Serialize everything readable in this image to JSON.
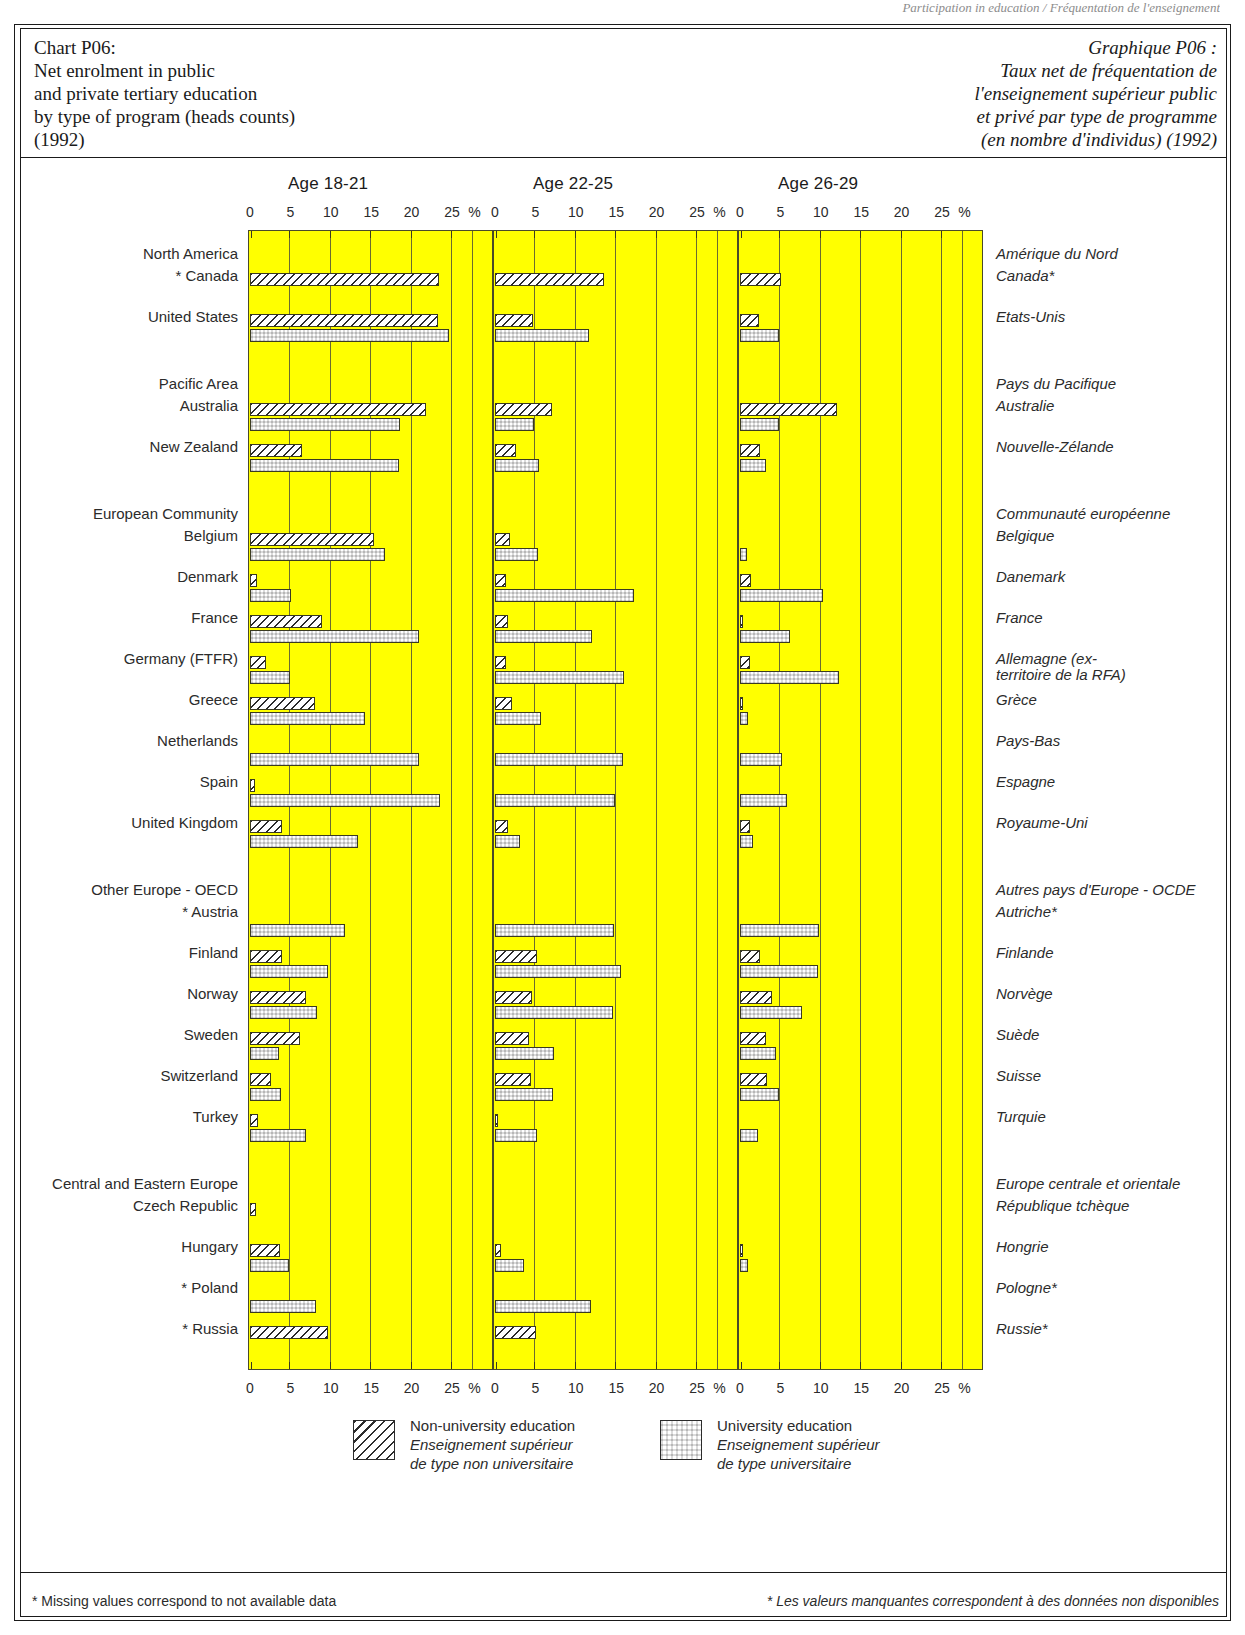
{
  "header_crumb": "Participation in education / Fréquentation de l'enseignement",
  "title": {
    "en": "Chart P06:\nNet enrolment in public\nand private tertiary education\nby type of program (heads counts)\n(1992)",
    "fr": "Graphique P06 :\nTaux net de fréquentation de\nl'enseignement supérieur public\net privé par type de programme\n(en nombre d'individus) (1992)"
  },
  "legend": {
    "nonuniversity": {
      "en": "Non-university education",
      "fr": "Enseignement supérieur\nde type non universitaire",
      "icon": "hatch-swatch"
    },
    "university": {
      "en": "University education",
      "fr": "Enseignement supérieur\nde type universitaire",
      "icon": "checker-swatch"
    }
  },
  "footnotes": {
    "en": "* Missing values correspond to not available data",
    "fr": "* Les valeurs manquantes correspondent à des données non disponibles"
  },
  "chart_data": {
    "type": "bar",
    "orientation": "horizontal",
    "title": "Net enrolment in public and private tertiary education by type of program (heads counts) (1992)",
    "xlabel": "%",
    "ylabel": "",
    "xlim": [
      0,
      30
    ],
    "ticks": [
      0,
      5,
      10,
      15,
      20,
      25
    ],
    "tick_labels": [
      "0",
      "5",
      "10",
      "15",
      "20",
      "25"
    ],
    "unit_label": "%",
    "grid": true,
    "legend_position": "bottom",
    "panels": [
      {
        "id": "age-18-21",
        "label": "Age 18-21"
      },
      {
        "id": "age-22-25",
        "label": "Age 22-25"
      },
      {
        "id": "age-26-29",
        "label": "Age 26-29"
      }
    ],
    "series": [
      {
        "name": "Non-university education",
        "key": "nonuni",
        "pattern": "diagonal-hatch"
      },
      {
        "name": "University education",
        "key": "uni",
        "pattern": "checkerboard"
      }
    ],
    "groups": [
      {
        "label_en": "North America",
        "label_fr": "Amérique du Nord",
        "rows": [
          {
            "label_en": "* Canada",
            "label_fr": "Canada*",
            "age_18_21": {
              "nonuni": 23.4,
              "uni": null
            },
            "age_22_25": {
              "nonuni": 13.5,
              "uni": null
            },
            "age_26_29": {
              "nonuni": 5.1,
              "uni": null
            }
          },
          {
            "label_en": "United States",
            "label_fr": "Etats-Unis",
            "age_18_21": {
              "nonuni": 23.3,
              "uni": 24.6
            },
            "age_22_25": {
              "nonuni": 4.7,
              "uni": 11.6
            },
            "age_26_29": {
              "nonuni": 2.4,
              "uni": 4.8
            }
          }
        ]
      },
      {
        "label_en": "Pacific Area",
        "label_fr": "Pays du Pacifique",
        "rows": [
          {
            "label_en": "Australia",
            "label_fr": "Australie",
            "age_18_21": {
              "nonuni": 21.8,
              "uni": 18.6
            },
            "age_22_25": {
              "nonuni": 7.1,
              "uni": 4.8
            },
            "age_26_29": {
              "nonuni": 12.0,
              "uni": 4.8
            }
          },
          {
            "label_en": "New Zealand",
            "label_fr": "Nouvelle-Zélande",
            "age_18_21": {
              "nonuni": 6.4,
              "uni": 18.5
            },
            "age_22_25": {
              "nonuni": 2.6,
              "uni": 5.5
            },
            "age_26_29": {
              "nonuni": 2.5,
              "uni": 3.2
            }
          }
        ]
      },
      {
        "label_en": "European Community",
        "label_fr": "Communauté européenne",
        "rows": [
          {
            "label_en": "Belgium",
            "label_fr": "Belgique",
            "age_18_21": {
              "nonuni": 15.3,
              "uni": 16.7
            },
            "age_22_25": {
              "nonuni": 1.9,
              "uni": 5.3
            },
            "age_26_29": {
              "nonuni": null,
              "uni": 0.9
            }
          },
          {
            "label_en": "Denmark",
            "label_fr": "Danemark",
            "age_18_21": {
              "nonuni": 0.9,
              "uni": 5.1
            },
            "age_22_25": {
              "nonuni": 1.4,
              "uni": 17.2
            },
            "age_26_29": {
              "nonuni": 1.3,
              "uni": 10.3
            }
          },
          {
            "label_en": "France",
            "label_fr": "France",
            "age_18_21": {
              "nonuni": 8.9,
              "uni": 20.9
            },
            "age_22_25": {
              "nonuni": 1.6,
              "uni": 12.0
            },
            "age_26_29": {
              "nonuni": 0.4,
              "uni": 6.2
            }
          },
          {
            "label_en": "Germany (FTFR)",
            "label_fr": "Allemagne (ex-\nterritoire de la RFA)",
            "age_18_21": {
              "nonuni": 2.0,
              "uni": 4.9
            },
            "age_22_25": {
              "nonuni": 1.3,
              "uni": 16.0
            },
            "age_26_29": {
              "nonuni": 1.2,
              "uni": 12.2
            }
          },
          {
            "label_en": "Greece",
            "label_fr": "Grèce",
            "age_18_21": {
              "nonuni": 8.0,
              "uni": 14.2
            },
            "age_22_25": {
              "nonuni": 2.1,
              "uni": 5.7
            },
            "age_26_29": {
              "nonuni": 0.4,
              "uni": 1.0
            }
          },
          {
            "label_en": "Netherlands",
            "label_fr": "Pays-Bas",
            "age_18_21": {
              "nonuni": null,
              "uni": 20.9
            },
            "age_22_25": {
              "nonuni": null,
              "uni": 15.8
            },
            "age_26_29": {
              "nonuni": null,
              "uni": 5.2
            }
          },
          {
            "label_en": "Spain",
            "label_fr": "Espagne",
            "age_18_21": {
              "nonuni": 0.6,
              "uni": 23.5
            },
            "age_22_25": {
              "nonuni": null,
              "uni": 14.8
            },
            "age_26_29": {
              "nonuni": null,
              "uni": 5.8
            }
          },
          {
            "label_en": "United Kingdom",
            "label_fr": "Royaume-Uni",
            "age_18_21": {
              "nonuni": 4.0,
              "uni": 13.4
            },
            "age_22_25": {
              "nonuni": 1.6,
              "uni": 3.1
            },
            "age_26_29": {
              "nonuni": 1.2,
              "uni": 1.6
            }
          }
        ]
      },
      {
        "label_en": "Other Europe - OECD",
        "label_fr": "Autres pays d'Europe - OCDE",
        "rows": [
          {
            "label_en": "* Austria",
            "label_fr": "Autriche*",
            "age_18_21": {
              "nonuni": null,
              "uni": 11.8
            },
            "age_22_25": {
              "nonuni": null,
              "uni": 14.7
            },
            "age_26_29": {
              "nonuni": null,
              "uni": 9.8
            }
          },
          {
            "label_en": "Finland",
            "label_fr": "Finlande",
            "age_18_21": {
              "nonuni": 4.0,
              "uni": 9.7
            },
            "age_22_25": {
              "nonuni": 5.2,
              "uni": 15.6
            },
            "age_26_29": {
              "nonuni": 2.5,
              "uni": 9.7
            }
          },
          {
            "label_en": "Norway",
            "label_fr": "Norvège",
            "age_18_21": {
              "nonuni": 6.9,
              "uni": 8.3
            },
            "age_22_25": {
              "nonuni": 4.6,
              "uni": 14.6
            },
            "age_26_29": {
              "nonuni": 3.9,
              "uni": 7.7
            }
          },
          {
            "label_en": "Sweden",
            "label_fr": "Suède",
            "age_18_21": {
              "nonuni": 6.2,
              "uni": 3.6
            },
            "age_22_25": {
              "nonuni": 4.2,
              "uni": 7.3
            },
            "age_26_29": {
              "nonuni": 3.2,
              "uni": 4.4
            }
          },
          {
            "label_en": "Switzerland",
            "label_fr": "Suisse",
            "age_18_21": {
              "nonuni": 2.6,
              "uni": 3.8
            },
            "age_22_25": {
              "nonuni": 4.4,
              "uni": 7.2
            },
            "age_26_29": {
              "nonuni": 3.4,
              "uni": 4.8
            }
          },
          {
            "label_en": "Turkey",
            "label_fr": "Turquie",
            "age_18_21": {
              "nonuni": 1.0,
              "uni": 6.9
            },
            "age_22_25": {
              "nonuni": 0.2,
              "uni": 5.2
            },
            "age_26_29": {
              "nonuni": null,
              "uni": 2.2
            }
          }
        ]
      },
      {
        "label_en": "Central and Eastern Europe",
        "label_fr": "Europe centrale et orientale",
        "rows": [
          {
            "label_en": "Czech Republic",
            "label_fr": "République tchèque",
            "age_18_21": {
              "nonuni": 0.7,
              "uni": null
            },
            "age_22_25": {
              "nonuni": null,
              "uni": null
            },
            "age_26_29": {
              "nonuni": null,
              "uni": null
            }
          },
          {
            "label_en": "Hungary",
            "label_fr": "Hongrie",
            "age_18_21": {
              "nonuni": 3.7,
              "uni": 4.8
            },
            "age_22_25": {
              "nonuni": 0.8,
              "uni": 3.6
            },
            "age_26_29": {
              "nonuni": 0.3,
              "uni": 1.0
            }
          },
          {
            "label_en": "* Poland",
            "label_fr": "Pologne*",
            "age_18_21": {
              "nonuni": null,
              "uni": 8.2
            },
            "age_22_25": {
              "nonuni": null,
              "uni": 11.9
            },
            "age_26_29": {
              "nonuni": null,
              "uni": null
            }
          },
          {
            "label_en": "* Russia",
            "label_fr": "Russie*",
            "age_18_21": {
              "nonuni": 9.6,
              "uni": null
            },
            "age_22_25": {
              "nonuni": 5.1,
              "uni": null
            },
            "age_26_29": {
              "nonuni": null,
              "uni": null
            }
          }
        ]
      }
    ]
  }
}
